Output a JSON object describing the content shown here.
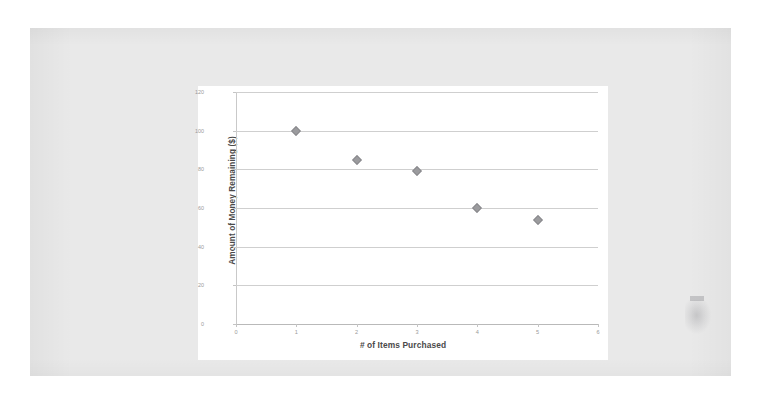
{
  "document": {
    "type": "scanned-page",
    "page_background": "#e9e9e9",
    "surround_background": "#ffffff",
    "artifact_note": ""
  },
  "chart_panel": {
    "background": "#ffffff"
  },
  "chart_data": {
    "type": "scatter",
    "title": "",
    "xlabel": "# of Items Purchased",
    "ylabel": "Amount of Money Remaining ($)",
    "x": [
      1,
      2,
      3,
      4,
      5
    ],
    "values": [
      100,
      85,
      79,
      60,
      54
    ],
    "series": [
      {
        "name": "Money Remaining",
        "x": [
          1,
          2,
          3,
          4,
          5
        ],
        "values": [
          100,
          85,
          79,
          60,
          54
        ],
        "marker": "diamond",
        "color": "#9b9b9e"
      }
    ],
    "xlim": [
      0,
      6
    ],
    "ylim": [
      0,
      120
    ],
    "xticks": [
      0,
      1,
      2,
      3,
      4,
      5,
      6
    ],
    "yticks": [
      0,
      20,
      40,
      60,
      80,
      100,
      120
    ],
    "xtick_labels": [
      "0",
      "1",
      "2",
      "3",
      "4",
      "5",
      "6"
    ],
    "ytick_labels": [
      "0",
      "20",
      "40",
      "60",
      "80",
      "100",
      "120"
    ],
    "grid": "horizontal",
    "gridline_color": "#cfcfcf",
    "legend": "none",
    "legend_position": "",
    "annotations": []
  }
}
